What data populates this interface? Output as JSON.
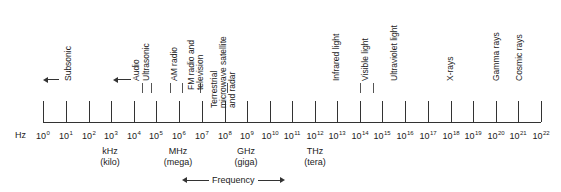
{
  "axis": {
    "unit_label": "Hz",
    "base": "10",
    "exponents": [
      "0",
      "1",
      "2",
      "3",
      "4",
      "5",
      "6",
      "7",
      "8",
      "9",
      "10",
      "11",
      "12",
      "13",
      "14",
      "15",
      "16",
      "17",
      "18",
      "19",
      "20",
      "21",
      "22"
    ]
  },
  "prefixes": [
    {
      "unit": "kHz",
      "name": "(kilo)"
    },
    {
      "unit": "MHz",
      "name": "(mega)"
    },
    {
      "unit": "GHz",
      "name": "(giga)"
    },
    {
      "unit": "THz",
      "name": "(tera)"
    }
  ],
  "bands": [
    {
      "label": "Subsonic"
    },
    {
      "label": "Audio"
    },
    {
      "label": "Ultrasonic"
    },
    {
      "label": "AM radio"
    },
    {
      "label": "FM radio and television"
    },
    {
      "label": "Terrestrial microwave satellite and radar"
    },
    {
      "label": "Infrared light"
    },
    {
      "label": "Visible light"
    },
    {
      "label": "Ultraviolet light"
    },
    {
      "label": "X-rays"
    },
    {
      "label": "Gamma rays"
    },
    {
      "label": "Cosmic rays"
    }
  ],
  "footer": {
    "frequency_label": "Frequency"
  }
}
